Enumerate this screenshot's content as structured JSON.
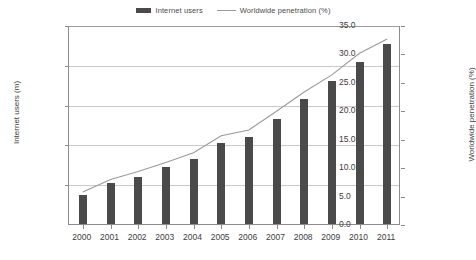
{
  "chart_data": {
    "type": "bar",
    "title": "",
    "subtitle": "",
    "xlabel": "",
    "ylabel": "Internet users (m)",
    "y2label": "Worldwide penetration (%)",
    "categories": [
      "2000",
      "2001",
      "2002",
      "2003",
      "2004",
      "2005",
      "2006",
      "2007",
      "2008",
      "2009",
      "2010",
      "2011"
    ],
    "series": [
      {
        "name": "Internet users",
        "type": "bar",
        "axis": "left",
        "unit": "m",
        "color": "#4a4a4a",
        "values": [
          361,
          513,
          587,
          719,
          817,
          1018,
          1093,
          1319,
          1574,
          1802,
          2034,
          2267
        ]
      },
      {
        "name": "Worldwide penetration (%)",
        "type": "line",
        "axis": "right",
        "unit": "%",
        "color": "#9a9a9a",
        "values": [
          5.8,
          8.0,
          9.4,
          11.0,
          12.7,
          15.7,
          16.7,
          20.0,
          23.4,
          26.4,
          30.2,
          32.7
        ]
      }
    ],
    "ylim": [
      0,
      2500
    ],
    "y2lim": [
      0,
      35
    ],
    "yticks": [
      "500",
      "1000",
      "1500",
      "2000",
      "2500"
    ],
    "ytick_values": [
      500,
      1000,
      1500,
      2000,
      2500
    ],
    "y2ticks": [
      "0.0",
      "5.0",
      "10.0",
      "15.0",
      "20.0",
      "25.0",
      "30.0",
      "35.0"
    ],
    "y2tick_values": [
      0,
      5,
      10,
      15,
      20,
      25,
      30,
      35
    ],
    "grid": true,
    "legend_position": "top-center",
    "legend": [
      {
        "label": "Internet users",
        "marker": "bar-swatch",
        "color": "#4a4a4a"
      },
      {
        "label": "Worldwide penetration (%)",
        "marker": "line-swatch",
        "color": "#9a9a9a"
      }
    ]
  }
}
